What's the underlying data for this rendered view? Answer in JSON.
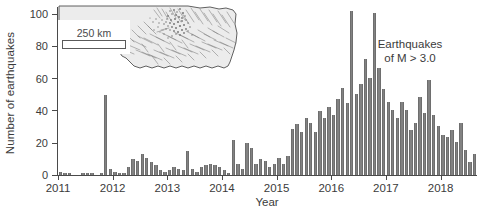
{
  "chart_data": {
    "type": "bar",
    "title": "",
    "xlabel": "Year",
    "ylabel": "Number of earthquakes",
    "ylim": [
      0,
      105
    ],
    "yticks": [
      0,
      20,
      40,
      60,
      80,
      100
    ],
    "ytick_labels": [
      "0",
      "20",
      "40",
      "60",
      "80",
      "100"
    ],
    "xticks": [
      2011,
      2012,
      2013,
      2014,
      2015,
      2016,
      2017,
      2018
    ],
    "xtick_labels": [
      "2011",
      "2012",
      "2013",
      "2014",
      "2015",
      "2016",
      "2017",
      "2018"
    ],
    "xlim": [
      2011.0,
      2018.67
    ],
    "grid": false,
    "legend": null,
    "annotation": {
      "line1": "Earthquakes",
      "line2": "of M > 3.0"
    },
    "bar_color": "#828282",
    "axis_color": "#4a4a4a",
    "x_interval": "monthly",
    "x_start": "2011-01",
    "categories": [
      "2011-01",
      "2011-02",
      "2011-03",
      "2011-04",
      "2011-05",
      "2011-06",
      "2011-07",
      "2011-08",
      "2011-09",
      "2011-10",
      "2011-11",
      "2011-12",
      "2012-01",
      "2012-02",
      "2012-03",
      "2012-04",
      "2012-05",
      "2012-06",
      "2012-07",
      "2012-08",
      "2012-09",
      "2012-10",
      "2012-11",
      "2012-12",
      "2013-01",
      "2013-02",
      "2013-03",
      "2013-04",
      "2013-05",
      "2013-06",
      "2013-07",
      "2013-08",
      "2013-09",
      "2013-10",
      "2013-11",
      "2013-12",
      "2014-01",
      "2014-02",
      "2014-03",
      "2014-04",
      "2014-05",
      "2014-06",
      "2014-07",
      "2014-08",
      "2014-09",
      "2014-10",
      "2014-11",
      "2014-12",
      "2015-01",
      "2015-02",
      "2015-03",
      "2015-04",
      "2015-05",
      "2015-06",
      "2015-07",
      "2015-08",
      "2015-09",
      "2015-10",
      "2015-11",
      "2015-12",
      "2016-01",
      "2016-02",
      "2016-03",
      "2016-04",
      "2016-05",
      "2016-06",
      "2016-07",
      "2016-08",
      "2016-09",
      "2016-10",
      "2016-11",
      "2016-12",
      "2017-01",
      "2017-02",
      "2017-03",
      "2017-04",
      "2017-05",
      "2017-06",
      "2017-07",
      "2017-08",
      "2017-09",
      "2017-10",
      "2017-11",
      "2017-12",
      "2018-01",
      "2018-02",
      "2018-03",
      "2018-04",
      "2018-05",
      "2018-06",
      "2018-07",
      "2018-08"
    ],
    "values": [
      2,
      1,
      1,
      0,
      0,
      1,
      1,
      1,
      0,
      1,
      50,
      4,
      2,
      1,
      1,
      5,
      10,
      9,
      13,
      11,
      8,
      6,
      3,
      2,
      3,
      5,
      4,
      3,
      15,
      4,
      2,
      5,
      6,
      7,
      6,
      5,
      3,
      1,
      22,
      7,
      4,
      20,
      17,
      7,
      10,
      9,
      5,
      7,
      11,
      7,
      12,
      29,
      32,
      27,
      36,
      33,
      27,
      40,
      36,
      43,
      38,
      48,
      55,
      45,
      103,
      51,
      57,
      73,
      61,
      102,
      67,
      54,
      46,
      41,
      36,
      46,
      41,
      28,
      33,
      49,
      39,
      60,
      38,
      31,
      25,
      24,
      28,
      21,
      33,
      16,
      8,
      13
    ]
  },
  "inset": {
    "scalebar_label": "250 km",
    "region_name": "oklahoma-state-outline",
    "feature_labels": {
      "faults": "mapped-faults",
      "epicenters": "earthquake-epicenters"
    }
  }
}
